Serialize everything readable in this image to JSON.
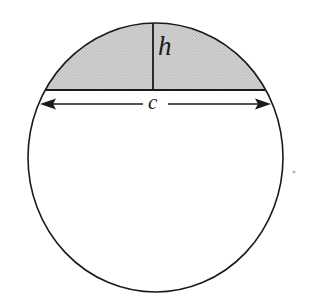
{
  "figure": {
    "background_color": "#ffffff",
    "stroke_color": "#1a1a1a",
    "segment_fill_color": "#c9c9c9",
    "labels": {
      "height_label": "h",
      "chord_label": "c"
    },
    "geometry": {
      "circle": {
        "center_x": 155.5,
        "center_y": 157.5,
        "radius_x": 127.5,
        "radius_y": 134.5,
        "stroke_width": 1.6
      },
      "chord": {
        "y": 90,
        "x_start": 46,
        "x_end": 265,
        "stroke_width": 1.8
      },
      "height_line": {
        "x": 153,
        "y_top": 23,
        "y_bottom": 90,
        "stroke_width": 1.8
      },
      "dimension_arrow": {
        "y": 104,
        "x_left_tip": 40,
        "x_right_tip": 271,
        "gap_left": 143,
        "gap_right": 168,
        "arrowhead_length": 15,
        "arrowhead_half_width": 5.5,
        "stroke_width": 1.4
      },
      "speck": {
        "x": 294,
        "y": 172,
        "radius": 1.6,
        "color": "#b8b8b8"
      }
    }
  }
}
